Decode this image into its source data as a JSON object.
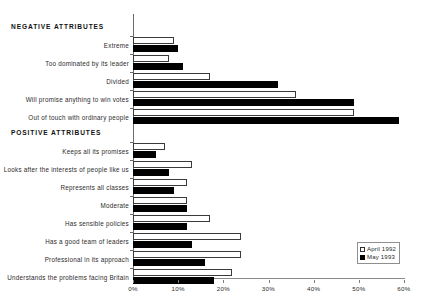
{
  "chart": {
    "type": "bar",
    "orientation": "horizontal",
    "axis": {
      "x_ticks": [
        "0%",
        "10%",
        "20%",
        "30%",
        "40%",
        "50%",
        "60%"
      ],
      "x_min": 0,
      "x_max": 60
    },
    "sections": [
      {
        "id": "negative",
        "title": "NEGATIVE ATTRIBUTES"
      },
      {
        "id": "positive",
        "title": "POSITIVE ATTRIBUTES"
      }
    ],
    "legend": {
      "position": "bottom-right",
      "items": [
        {
          "label": "April 1992",
          "style": "open",
          "color": "#ffffff"
        },
        {
          "label": "May  1993",
          "style": "filled",
          "color": "#000000"
        }
      ]
    }
  },
  "chart_data": {
    "type": "bar",
    "orientation": "horizontal",
    "title": "",
    "subtitle": "",
    "xlabel": "",
    "ylabel": "",
    "xlim": [
      0,
      60
    ],
    "xticks": [
      0,
      10,
      20,
      30,
      40,
      50,
      60
    ],
    "xticklabels": [
      "0%",
      "10%",
      "20%",
      "30%",
      "40%",
      "50%",
      "60%"
    ],
    "grid": false,
    "legend_position": "bottom-right",
    "group_labels": [
      "NEGATIVE ATTRIBUTES",
      "POSITIVE ATTRIBUTES"
    ],
    "categories": [
      "Extreme",
      "Too dominated by its leader",
      "Divided",
      "Will promise anything to win votes",
      "Out of touch with ordinary people",
      "Keeps all its promises",
      "Looks after the interests of people like us",
      "Represents all classes",
      "Moderate",
      "Has sensible policies",
      "Has a good team of leaders",
      "Professional in its approach",
      "Understands the problems facing Britain"
    ],
    "category_groups": [
      "NEGATIVE ATTRIBUTES",
      "NEGATIVE ATTRIBUTES",
      "NEGATIVE ATTRIBUTES",
      "NEGATIVE ATTRIBUTES",
      "NEGATIVE ATTRIBUTES",
      "POSITIVE ATTRIBUTES",
      "POSITIVE ATTRIBUTES",
      "POSITIVE ATTRIBUTES",
      "POSITIVE ATTRIBUTES",
      "POSITIVE ATTRIBUTES",
      "POSITIVE ATTRIBUTES",
      "POSITIVE ATTRIBUTES",
      "POSITIVE ATTRIBUTES"
    ],
    "series": [
      {
        "name": "April 1992",
        "color": "#ffffff",
        "edge_color": "#000000",
        "values": [
          9,
          8,
          17,
          36,
          49,
          7,
          13,
          12,
          12,
          17,
          24,
          24,
          22
        ]
      },
      {
        "name": "May  1993",
        "color": "#000000",
        "edge_color": "#000000",
        "values": [
          10,
          11,
          32,
          49,
          59,
          5,
          8,
          9,
          12,
          12,
          13,
          16,
          18
        ]
      }
    ]
  }
}
